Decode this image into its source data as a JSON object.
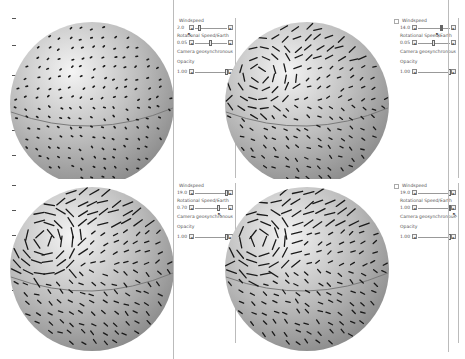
{
  "panels": [
    {
      "id": "top-left",
      "windspeed_label": "Windspeed",
      "windspeed_value": "2.0",
      "windspeed_pos": 0.1,
      "rotation_label": "Rotational Speed/Earth",
      "rotation_value": "0.05",
      "rotation_pos": 0.45,
      "camera_label": "Camera geosynchronous",
      "opacity_label": "Opacity",
      "opacity_value": "1.00",
      "opacity_pos": 1.0
    },
    {
      "id": "top-right",
      "windspeed_label": "Windspeed",
      "windspeed_value": "14.0",
      "windspeed_pos": 0.72,
      "rotation_label": "Rotational Speed/Earth",
      "rotation_value": "0.05",
      "rotation_pos": 0.45,
      "camera_label": "Camera geosynchronous",
      "opacity_label": "Opacity",
      "opacity_value": "1.00",
      "opacity_pos": 1.0
    },
    {
      "id": "bottom-left",
      "windspeed_label": "Windspeed",
      "windspeed_value": "19.0",
      "windspeed_pos": 1.0,
      "rotation_label": "Rotational Speed/Earth",
      "rotation_value": "0.70",
      "rotation_pos": 0.72,
      "camera_label": "Camera geosynchronous",
      "opacity_label": "Opacity",
      "opacity_value": "1.00",
      "opacity_pos": 1.0
    },
    {
      "id": "bottom-right",
      "windspeed_label": "Windspeed",
      "windspeed_value": "19.0",
      "windspeed_pos": 1.0,
      "rotation_label": "Rotational Speed/Earth",
      "rotation_value": "1.00",
      "rotation_pos": 1.0,
      "camera_label": "Camera geosynchronous",
      "opacity_label": "Opacity",
      "opacity_value": "1.00",
      "opacity_pos": 1.0
    }
  ],
  "icons": {
    "slider_left": "◂",
    "slider_right": "▸",
    "cursor": "↖"
  },
  "colors": {
    "sphere_light": "#f4f4f4",
    "sphere_mid": "#bdbdbd",
    "sphere_dark": "#8a8a8a",
    "wind_marks": "#1a1a1a",
    "equator": "#7a7a7a"
  }
}
